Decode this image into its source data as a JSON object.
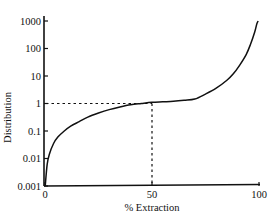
{
  "chart_data": {
    "type": "line",
    "title": "",
    "xlabel": "% Extraction",
    "ylabel": "Distribution",
    "xlim": [
      0,
      100
    ],
    "ylim": [
      0.001,
      1000
    ],
    "yscale": "log",
    "grid": false,
    "x_ticks": [
      {
        "value": 0,
        "label": "0"
      },
      {
        "value": 50,
        "label": "50"
      },
      {
        "value": 100,
        "label": "100"
      }
    ],
    "y_ticks": [
      {
        "value": 0.001,
        "label": "0.001"
      },
      {
        "value": 0.01,
        "label": "0.01"
      },
      {
        "value": 0.1,
        "label": "0.1"
      },
      {
        "value": 1,
        "label": "1"
      },
      {
        "value": 10,
        "label": "10"
      },
      {
        "value": 100,
        "label": "100"
      },
      {
        "value": 1000,
        "label": "1000"
      }
    ],
    "series": [
      {
        "name": "Distribution vs % Extraction",
        "x": [
          0.1,
          1,
          2,
          4,
          6,
          9,
          12,
          16,
          20,
          25,
          30,
          35,
          40,
          45,
          50,
          55,
          60,
          65,
          70,
          75,
          80,
          85,
          88,
          91,
          94,
          96,
          98,
          99,
          99.6
        ],
        "y": [
          0.001,
          0.006,
          0.014,
          0.035,
          0.06,
          0.1,
          0.15,
          0.22,
          0.32,
          0.45,
          0.6,
          0.75,
          0.9,
          1.0,
          1.1,
          1.15,
          1.2,
          1.3,
          1.45,
          2.2,
          3.6,
          7,
          12,
          25,
          60,
          140,
          400,
          800,
          1000
        ]
      }
    ],
    "annotations": [
      {
        "type": "dashed-guide",
        "description": "horizontal dashed line from y-axis at Distribution = 1 to curve at 50% extraction",
        "x": 50,
        "y": 1
      },
      {
        "type": "dashed-guide",
        "description": "vertical dashed line from x-axis at 50% extraction up to Distribution = 1",
        "x": 50,
        "y": 1
      }
    ],
    "legend": "none"
  }
}
